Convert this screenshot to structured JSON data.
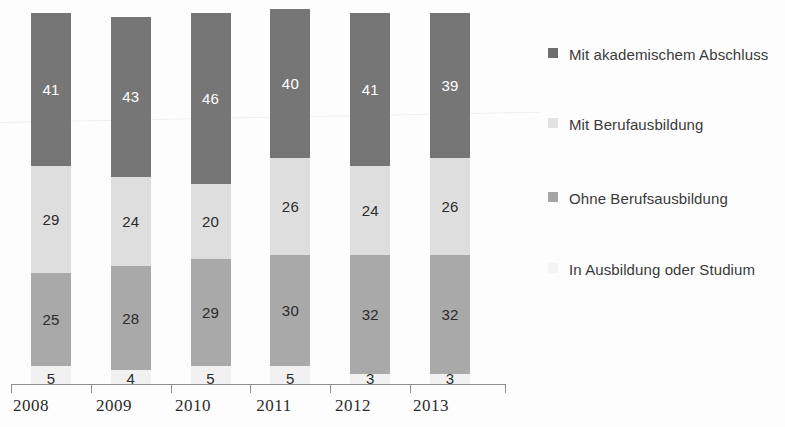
{
  "chart_data": {
    "type": "bar",
    "variant": "stacked-column-percent",
    "title": "",
    "subtitle": "",
    "xlabel": "",
    "ylabel": "",
    "grid": false,
    "ylim": [
      0,
      100
    ],
    "legend_position": "right",
    "categories": [
      "2008",
      "2009",
      "2010",
      "2011",
      "2012",
      "2013"
    ],
    "series": [
      {
        "name": "In Ausbildung oder Studium",
        "key": "intraining",
        "color": "#f1f1f1",
        "values": [
          5,
          4,
          5,
          5,
          3,
          3
        ]
      },
      {
        "name": "Ohne Berufsausbildung",
        "key": "none",
        "color": "#a9a9a9",
        "values": [
          25,
          28,
          29,
          30,
          32,
          32
        ]
      },
      {
        "name": "Mit Berufausbildung",
        "key": "vocational",
        "color": "#dedede",
        "values": [
          29,
          24,
          20,
          26,
          24,
          26
        ]
      },
      {
        "name": "Mit akademischem Abschluss",
        "key": "academic",
        "color": "#767676",
        "values": [
          41,
          43,
          46,
          40,
          41,
          39
        ]
      }
    ],
    "stack_order_bottom_to_top": [
      "intraining",
      "none",
      "vocational",
      "academic"
    ]
  },
  "axis": {
    "x_tick_labels": [
      "2008",
      "2009",
      "2010",
      "2011",
      "2012",
      "2013"
    ]
  },
  "legend": {
    "items": [
      {
        "label": "Mit akademischem Abschluss",
        "key": "academic",
        "color": "#6f6f6f"
      },
      {
        "label": "Mit Berufausbildung",
        "key": "vocational",
        "color": "#e2e2e2"
      },
      {
        "label": "Ohne Berufsausbildung",
        "key": "none",
        "color": "#a5a5a5"
      },
      {
        "label": "In Ausbildung oder Studium",
        "key": "intraining",
        "color": "#f4f4f4"
      }
    ]
  },
  "bar_labels": {
    "b2008": {
      "academic": "41",
      "vocational": "29",
      "none": "25",
      "intraining": "5"
    },
    "b2009": {
      "academic": "43",
      "vocational": "24",
      "none": "28",
      "intraining": "4"
    },
    "b2010": {
      "academic": "46",
      "vocational": "20",
      "none": "29",
      "intraining": "5"
    },
    "b2011": {
      "academic": "40",
      "vocational": "26",
      "none": "30",
      "intraining": "5"
    },
    "b2012": {
      "academic": "41",
      "vocational": "24",
      "none": "32",
      "intraining": "3"
    },
    "b2013": {
      "academic": "39",
      "vocational": "26",
      "none": "32",
      "intraining": "3"
    }
  }
}
